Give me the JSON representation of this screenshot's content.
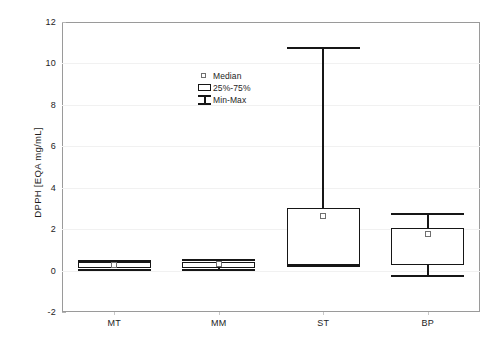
{
  "chart_data": {
    "type": "box",
    "title": "",
    "xlabel": "",
    "ylabel": "DPPH [EQA mg/mL]",
    "categories": [
      "MT",
      "MM",
      "ST",
      "BP"
    ],
    "ylim": [
      -2,
      12
    ],
    "y_ticks": [
      12,
      10,
      8,
      6,
      4,
      2,
      0,
      -2
    ],
    "grid": false,
    "legend_position": "inside-upper-center",
    "legend": [
      {
        "marker": "open-square",
        "label": "Median"
      },
      {
        "marker": "box",
        "label": "25%-75%"
      },
      {
        "marker": "whisker",
        "label": "Min-Max"
      }
    ],
    "series": [
      {
        "name": "MT",
        "min": 0.05,
        "q1": 0.1,
        "median": 0.25,
        "q3": 0.4,
        "max": 0.45
      },
      {
        "name": "MM",
        "min": 0.05,
        "q1": 0.12,
        "median": 0.3,
        "q3": 0.42,
        "max": 0.5
      },
      {
        "name": "ST",
        "min": 0.2,
        "q1": 0.27,
        "median": 2.65,
        "q3": 3.0,
        "max": 10.75
      },
      {
        "name": "BP",
        "min": -0.27,
        "q1": 0.27,
        "median": 1.77,
        "q3": 2.06,
        "max": 2.73
      }
    ]
  },
  "axis": {
    "y_tick_labels": [
      "12",
      "10",
      "8",
      "6",
      "4",
      "2",
      "0",
      "-2"
    ],
    "y_title": "DPPH [EQA mg/mL]",
    "x_tick_labels": [
      "MT",
      "MM",
      "ST",
      "BP"
    ]
  },
  "legend": {
    "median_label": "Median",
    "quartile_label": "25%-75%",
    "minmax_label": "Min-Max"
  },
  "colors": {
    "ink": "#161616",
    "frame": "#9a9a9a",
    "median_marker": "#6f6f6f",
    "background": "#ffffff"
  }
}
